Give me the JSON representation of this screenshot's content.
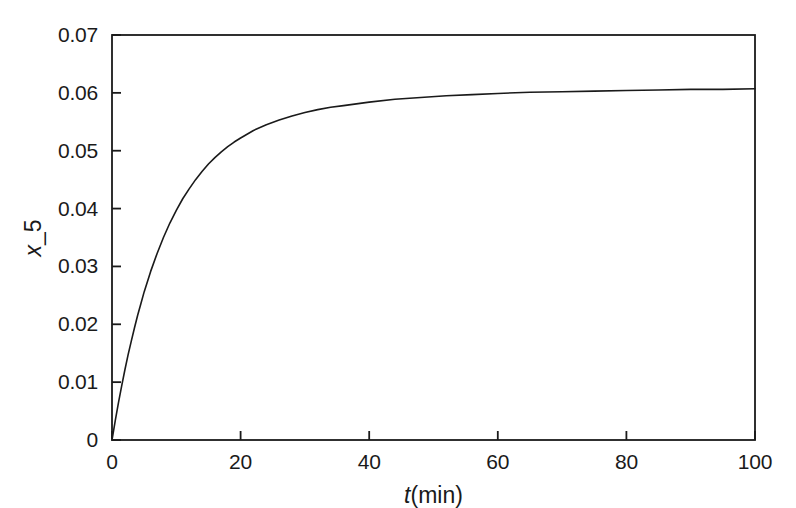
{
  "chart_data": {
    "type": "line",
    "title": "",
    "xlabel": "t(min)",
    "xlabel_variable": "t",
    "xlabel_unit": "(min)",
    "ylabel": "x_5",
    "ylabel_variable": "x",
    "ylabel_subscript": "_5",
    "xlim": [
      0,
      100
    ],
    "ylim": [
      0,
      0.07
    ],
    "xticks": [
      0,
      20,
      40,
      60,
      80,
      100
    ],
    "xtick_labels": [
      "0",
      "20",
      "40",
      "60",
      "80",
      "100"
    ],
    "yticks": [
      0,
      0.01,
      0.02,
      0.03,
      0.04,
      0.05,
      0.06,
      0.07
    ],
    "ytick_labels": [
      "0",
      "0.01",
      "0.02",
      "0.03",
      "0.04",
      "0.05",
      "0.06",
      "0.07"
    ],
    "grid": false,
    "legend": false,
    "legend_position": "none",
    "line_color": "#1a1a1a",
    "line_width": 1.6,
    "background_color": "#ffffff",
    "frame_color": "#1a1a1a",
    "series": [
      {
        "name": "x_5",
        "x": [
          0,
          0.5,
          1,
          1.5,
          2,
          2.5,
          3,
          3.5,
          4,
          4.5,
          5,
          6,
          7,
          8,
          9,
          10,
          11,
          12,
          13,
          14,
          15,
          16,
          17,
          18,
          19,
          20,
          22,
          24,
          26,
          28,
          30,
          32,
          34,
          36,
          38,
          40,
          44,
          48,
          52,
          56,
          60,
          65,
          70,
          75,
          80,
          85,
          90,
          95,
          100
        ],
        "y": [
          0.0,
          0.0033,
          0.0064,
          0.0093,
          0.0121,
          0.0147,
          0.0171,
          0.0194,
          0.0216,
          0.0236,
          0.0256,
          0.0291,
          0.0322,
          0.035,
          0.0375,
          0.0397,
          0.0417,
          0.0434,
          0.045,
          0.0464,
          0.0477,
          0.0488,
          0.0498,
          0.0507,
          0.0515,
          0.0522,
          0.0535,
          0.0545,
          0.0553,
          0.056,
          0.0566,
          0.0571,
          0.0575,
          0.0578,
          0.0581,
          0.0584,
          0.0589,
          0.0592,
          0.0595,
          0.0597,
          0.0599,
          0.0601,
          0.0602,
          0.0603,
          0.0604,
          0.0605,
          0.0606,
          0.0606,
          0.0607
        ]
      }
    ]
  },
  "axes": {
    "y_label_text": "x",
    "y_label_sub": "_5"
  }
}
